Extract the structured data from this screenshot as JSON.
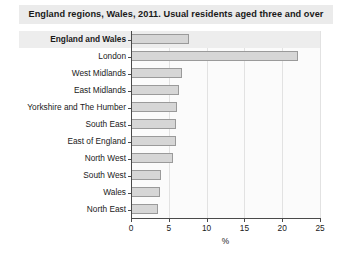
{
  "chart_data": {
    "type": "bar",
    "orientation": "horizontal",
    "title": "England regions, Wales, 2011. Usual residents aged three and over",
    "xlabel": "%",
    "ylabel": "",
    "xlim": [
      0,
      25
    ],
    "xticks": [
      0,
      5,
      10,
      15,
      20,
      25
    ],
    "grid": true,
    "legend": null,
    "categories": [
      "England and Wales",
      "London",
      "West Midlands",
      "East Midlands",
      "Yorkshire and The Humber",
      "South East",
      "East of England",
      "North West",
      "South West",
      "Wales",
      "North East"
    ],
    "values": [
      7.7,
      22.1,
      6.8,
      6.3,
      6.1,
      6.0,
      5.9,
      5.6,
      4.0,
      3.9,
      3.6
    ],
    "emphasized_category": "England and Wales",
    "bar_fill_color": "#d6d6d6",
    "bar_border_color": "#9a9a9a",
    "highlight_band_color": "#ededed"
  }
}
